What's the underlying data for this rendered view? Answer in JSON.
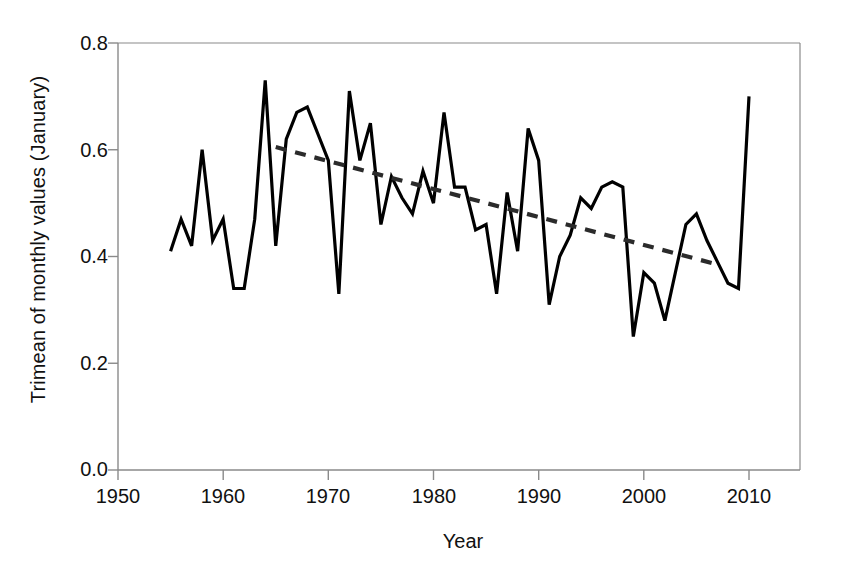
{
  "chart_data": {
    "type": "line",
    "title": "",
    "xlabel": "Year",
    "ylabel": "Trimean of monthly values (January)",
    "xlim": [
      1950,
      2012.5
    ],
    "ylim": [
      0.0,
      0.8
    ],
    "xticks": [
      1950,
      1960,
      1970,
      1980,
      1990,
      2000,
      2010
    ],
    "yticks": [
      "0.0",
      "0.2",
      "0.4",
      "0.6",
      "0.8"
    ],
    "grid": false,
    "legend": "none",
    "series": [
      {
        "name": "Trimean of monthly values (January)",
        "style": "solid",
        "color": "#000000",
        "x": [
          1955,
          1956,
          1957,
          1958,
          1959,
          1960,
          1961,
          1962,
          1963,
          1964,
          1965,
          1966,
          1967,
          1968,
          1969,
          1970,
          1971,
          1972,
          1973,
          1974,
          1975,
          1976,
          1977,
          1978,
          1979,
          1980,
          1981,
          1982,
          1983,
          1984,
          1985,
          1986,
          1987,
          1988,
          1989,
          1990,
          1991,
          1992,
          1993,
          1994,
          1995,
          1996,
          1997,
          1998,
          1999,
          2000,
          2001,
          2002,
          2003,
          2004,
          2005,
          2006,
          2007,
          2008,
          2009,
          2010
        ],
        "y": [
          0.41,
          0.47,
          0.42,
          0.6,
          0.43,
          0.47,
          0.34,
          0.34,
          0.47,
          0.73,
          0.42,
          0.62,
          0.67,
          0.68,
          0.63,
          0.58,
          0.33,
          0.71,
          0.58,
          0.65,
          0.46,
          0.55,
          0.51,
          0.48,
          0.56,
          0.5,
          0.67,
          0.53,
          0.53,
          0.45,
          0.46,
          0.33,
          0.52,
          0.41,
          0.64,
          0.58,
          0.31,
          0.4,
          0.44,
          0.51,
          0.49,
          0.53,
          0.54,
          0.53,
          0.25,
          0.37,
          0.35,
          0.28,
          0.37,
          0.46,
          0.48,
          0.43,
          0.39,
          0.35,
          0.34,
          0.7
        ]
      },
      {
        "name": "Linear trend",
        "style": "dashed",
        "color": "#333333",
        "x": [
          1965,
          2007
        ],
        "y": [
          0.605,
          0.385
        ]
      }
    ]
  },
  "axes": {
    "y_tick_labels": [
      "0.8",
      "0.6",
      "0.4",
      "0.2",
      "0.0"
    ],
    "x_tick_labels": [
      "1950",
      "1960",
      "1970",
      "1980",
      "1990",
      "2000",
      "2010"
    ],
    "x_axis_title": "Year",
    "y_axis_title": "Trimean of monthly values (January)"
  }
}
